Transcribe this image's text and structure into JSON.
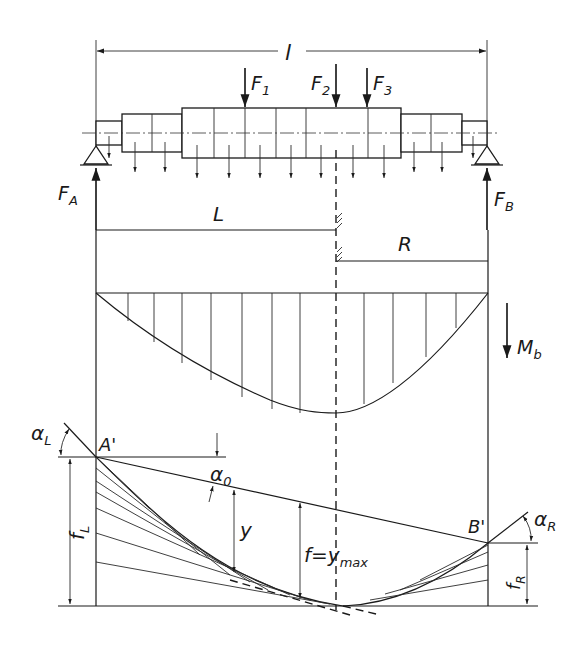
{
  "diagram": {
    "span_label": "l",
    "forces": {
      "point_loads": [
        "F1",
        "F2",
        "F3"
      ],
      "support_reactions": [
        "FA",
        "FB"
      ]
    },
    "labels": {
      "span": "l",
      "F1_main": "F",
      "F1_sub": "1",
      "F2_main": "F",
      "F2_sub": "2",
      "F3_main": "F",
      "F3_sub": "3",
      "FA_main": "F",
      "FA_sub": "A",
      "FB_main": "F",
      "FB_sub": "B",
      "left_part": "L",
      "right_part": "R",
      "moment_main": "M",
      "moment_sub": "b",
      "alphaL_main": "α",
      "alphaL_sub": "L",
      "alphaR_main": "α",
      "alphaR_sub": "R",
      "alpha0_main": "α",
      "alpha0_sub": "0",
      "A_prime": "A'",
      "B_prime": "B'",
      "y": "y",
      "fmax_main": "f=y",
      "fmax_sub": "max",
      "fL_main": "f",
      "fL_sub": "L",
      "fR_main": "f",
      "fR_sub": "R"
    },
    "sections": [
      "shaft-with-loads",
      "left-right-division",
      "bending-moment-diagram",
      "deflection-construction"
    ],
    "colors": {
      "line": "#1a1a1a",
      "background": "#ffffff"
    }
  }
}
